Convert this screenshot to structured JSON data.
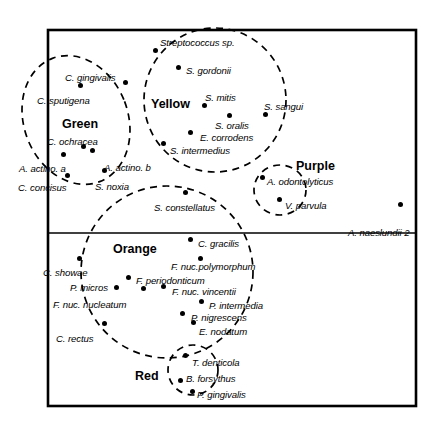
{
  "figure": {
    "frame": {
      "x": 48,
      "y": 30,
      "width": 368,
      "height": 376
    },
    "divider_y": 233,
    "line_color": "#000000",
    "background_color": "#ffffff"
  },
  "complexes": [
    {
      "key": "green",
      "name": "Green",
      "name_x": 62,
      "name_y": 118,
      "shape": "ellipse",
      "cx": 76,
      "cy": 120,
      "rx": 52,
      "ry": 66,
      "rotate": -21,
      "members": [
        "C. gingivalis",
        "C. sputigena",
        "C. ochracea",
        "A. actino. a",
        "C. concisus",
        "E. corrodens"
      ]
    },
    {
      "key": "yellow",
      "name": "Yellow",
      "name_x": 151,
      "name_y": 98,
      "shape": "ellipse",
      "cx": 215,
      "cy": 100,
      "rx": 71,
      "ry": 72,
      "rotate": 0,
      "members": [
        "Streptococcus sp.",
        "S. gordonii",
        "S. mitis",
        "S. sangui",
        "S. oralis",
        "E. corrodens",
        "S. intermedius"
      ]
    },
    {
      "key": "purple",
      "name": "Purple",
      "name_x": 296,
      "name_y": 160,
      "shape": "circle",
      "cx": 280,
      "cy": 190,
      "rx": 26,
      "ry": 25,
      "rotate": 0,
      "members": [
        "A. odontolyticus",
        "V. parvula"
      ]
    },
    {
      "key": "orange",
      "name": "Orange",
      "name_x": 113,
      "name_y": 243,
      "shape": "circle",
      "cx": 167,
      "cy": 272,
      "rx": 86,
      "ry": 86,
      "rotate": 0,
      "members": [
        "C. gracilis",
        "F. nuc.polymorphum",
        "F. periodonticum",
        "F. nuc. vincentii",
        "P. intermedia",
        "P. nigrescens",
        "E. nodatum",
        "C. showae",
        "P. micros",
        "F. nuc. nucleatum",
        "C. rectus",
        "S. constellatus"
      ]
    },
    {
      "key": "red",
      "name": "Red",
      "name_x": 135,
      "name_y": 370,
      "shape": "circle",
      "cx": 193,
      "cy": 370,
      "rx": 25,
      "ry": 25,
      "rotate": 0,
      "members": [
        "T. denticola",
        "B. forsythus",
        "P. gingivalis"
      ]
    }
  ],
  "species": [
    {
      "name": "Streptococcus sp.",
      "complex": "yellow",
      "label_x": 160,
      "label_y": 38,
      "dot_x": 155,
      "dot_y": 50
    },
    {
      "name": "S. gordonii",
      "complex": "yellow",
      "label_x": 186,
      "label_y": 66,
      "dot_x": 178,
      "dot_y": 67
    },
    {
      "name": "S. mitis",
      "complex": "yellow",
      "label_x": 205,
      "label_y": 93,
      "dot_x": 204,
      "dot_y": 105
    },
    {
      "name": "S. sangui",
      "complex": "yellow",
      "label_x": 264,
      "label_y": 102,
      "dot_x": 265,
      "dot_y": 114
    },
    {
      "name": "S. oralis",
      "complex": "yellow",
      "label_x": 215,
      "label_y": 121,
      "dot_x": 229,
      "dot_y": 115
    },
    {
      "name": "E. corrodens",
      "complex": "yellow",
      "label_x": 200,
      "label_y": 133,
      "dot_x": 190,
      "dot_y": 132
    },
    {
      "name": "S. intermedius",
      "complex": "yellow",
      "label_x": 170,
      "label_y": 146,
      "dot_x": 163,
      "dot_y": 143
    },
    {
      "name": "C. gingivalis",
      "complex": "green",
      "label_x": 65,
      "label_y": 73,
      "dot_x": 80,
      "dot_y": 85
    },
    {
      "name": "C. sputigena",
      "complex": "green",
      "label_x": 37,
      "label_y": 96,
      "dot_x": 125,
      "dot_y": 82
    },
    {
      "name": "C. ochracea",
      "complex": "green",
      "label_x": 47,
      "label_y": 137,
      "dot_x": 83,
      "dot_y": 146
    },
    {
      "name": "A. actino. a",
      "complex": "green",
      "label_x": 19,
      "label_y": 164,
      "dot_x": 63,
      "dot_y": 154
    },
    {
      "name": "C. concisus",
      "complex": "green",
      "label_x": 18,
      "label_y": 183,
      "dot_x": 67,
      "dot_y": 175
    },
    {
      "name": "A. actino. b",
      "complex": "green",
      "label_x": 104,
      "label_y": 163,
      "dot_x": 92,
      "dot_y": 150
    },
    {
      "name": "S. noxia",
      "complex": "green",
      "label_x": 95,
      "label_y": 182,
      "dot_x": 104,
      "dot_y": 170
    },
    {
      "name": "A. odontolyticus",
      "complex": "purple",
      "label_x": 267,
      "label_y": 177,
      "dot_x": 262,
      "dot_y": 177
    },
    {
      "name": "V. parvula",
      "complex": "purple",
      "label_x": 285,
      "label_y": 201,
      "dot_x": 279,
      "dot_y": 199
    },
    {
      "name": "A. naeslundii 2",
      "complex": "none",
      "label_x": 348,
      "label_y": 228,
      "dot_x": 400,
      "dot_y": 204
    },
    {
      "name": "S. constellatus",
      "complex": "orange",
      "label_x": 154,
      "label_y": 203,
      "dot_x": 185,
      "dot_y": 192
    },
    {
      "name": "C. gracilis",
      "complex": "orange",
      "label_x": 198,
      "label_y": 239,
      "dot_x": 190,
      "dot_y": 239
    },
    {
      "name": "F. nuc.polymorphum",
      "complex": "orange",
      "label_x": 171,
      "label_y": 262,
      "dot_x": 200,
      "dot_y": 258
    },
    {
      "name": "F. periodonticum",
      "complex": "orange",
      "label_x": 136,
      "label_y": 276,
      "dot_x": 128,
      "dot_y": 277
    },
    {
      "name": "F. nuc. vincentii",
      "complex": "orange",
      "label_x": 172,
      "label_y": 287,
      "dot_x": 163,
      "dot_y": 286
    },
    {
      "name": "P. intermedia",
      "complex": "orange",
      "label_x": 209,
      "label_y": 301,
      "dot_x": 201,
      "dot_y": 301
    },
    {
      "name": "P. nigrescens",
      "complex": "orange",
      "label_x": 191,
      "label_y": 313,
      "dot_x": 182,
      "dot_y": 313
    },
    {
      "name": "E. nodatum",
      "complex": "orange",
      "label_x": 199,
      "label_y": 327,
      "dot_x": 193,
      "dot_y": 322
    },
    {
      "name": "C. showae",
      "complex": "orange",
      "label_x": 43,
      "label_y": 268,
      "dot_x": 79,
      "dot_y": 258
    },
    {
      "name": "P. micros",
      "complex": "orange",
      "label_x": 70,
      "label_y": 283,
      "dot_x": 116,
      "dot_y": 287
    },
    {
      "name": "F. nuc. nucleatum",
      "complex": "orange",
      "label_x": 53,
      "label_y": 300,
      "dot_x": 143,
      "dot_y": 288
    },
    {
      "name": "C. rectus",
      "complex": "orange",
      "label_x": 56,
      "label_y": 334,
      "dot_x": 104,
      "dot_y": 323
    },
    {
      "name": "T. denticola",
      "complex": "red",
      "label_x": 192,
      "label_y": 358,
      "dot_x": 185,
      "dot_y": 355
    },
    {
      "name": "B. forsythus",
      "complex": "red",
      "label_x": 186,
      "label_y": 374,
      "dot_x": 180,
      "dot_y": 380
    },
    {
      "name": "P. gingivalis",
      "complex": "red",
      "label_x": 197,
      "label_y": 390,
      "dot_x": 192,
      "dot_y": 391
    }
  ]
}
